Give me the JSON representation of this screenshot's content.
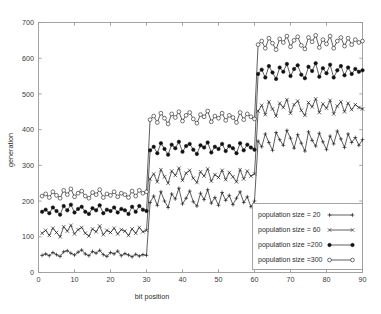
{
  "chart_data": {
    "type": "line",
    "title": "",
    "xlabel": "bit position",
    "ylabel": "generation",
    "xlim": [
      0,
      90
    ],
    "ylim": [
      0,
      700
    ],
    "xticks": [
      0,
      10,
      20,
      30,
      40,
      50,
      60,
      70,
      80,
      90
    ],
    "yticks": [
      0,
      100,
      200,
      300,
      400,
      500,
      600,
      700
    ],
    "grid": false,
    "legend_position": "lower right",
    "x": [
      1,
      2,
      3,
      4,
      5,
      6,
      7,
      8,
      9,
      10,
      11,
      12,
      13,
      14,
      15,
      16,
      17,
      18,
      19,
      20,
      21,
      22,
      23,
      24,
      25,
      26,
      27,
      28,
      29,
      30,
      31,
      32,
      33,
      34,
      35,
      36,
      37,
      38,
      39,
      40,
      41,
      42,
      43,
      44,
      45,
      46,
      47,
      48,
      49,
      50,
      51,
      52,
      53,
      54,
      55,
      56,
      57,
      58,
      59,
      60,
      61,
      62,
      63,
      64,
      65,
      66,
      67,
      68,
      69,
      70,
      71,
      72,
      73,
      74,
      75,
      76,
      77,
      78,
      79,
      80,
      81,
      82,
      83,
      84,
      85,
      86,
      87,
      88,
      89,
      90
    ],
    "series": [
      {
        "name": "population size = 20",
        "marker": "plus",
        "values": [
          48,
          52,
          47,
          56,
          50,
          45,
          58,
          61,
          54,
          49,
          57,
          63,
          52,
          47,
          59,
          54,
          62,
          50,
          45,
          56,
          52,
          60,
          47,
          53,
          49,
          44,
          51,
          46,
          50,
          48,
          196,
          214,
          188,
          226,
          200,
          182,
          220,
          206,
          236,
          192,
          208,
          228,
          198,
          186,
          222,
          204,
          232,
          194,
          210,
          188,
          224,
          202,
          216,
          190,
          208,
          226,
          196,
          212,
          184,
          200,
          368,
          352,
          388,
          364,
          342,
          392,
          372,
          356,
          398,
          376,
          348,
          386,
          362,
          340,
          394,
          370,
          354,
          390,
          366,
          344,
          382,
          360,
          396,
          374,
          350,
          388,
          364,
          378,
          356,
          372
        ]
      },
      {
        "name": "population size = 60",
        "marker": "cross",
        "values": [
          110,
          118,
          104,
          124,
          112,
          100,
          128,
          116,
          132,
          108,
          120,
          126,
          110,
          102,
          122,
          114,
          130,
          106,
          118,
          112,
          124,
          108,
          120,
          116,
          104,
          122,
          110,
          126,
          114,
          118,
          262,
          276,
          254,
          288,
          268,
          250,
          284,
          272,
          292,
          258,
          278,
          286,
          264,
          252,
          282,
          270,
          290,
          256,
          274,
          266,
          286,
          260,
          280,
          268,
          254,
          288,
          262,
          284,
          270,
          276,
          452,
          468,
          442,
          478,
          458,
          438,
          474,
          462,
          484,
          446,
          470,
          480,
          454,
          440,
          476,
          464,
          486,
          448,
          472,
          460,
          482,
          444,
          466,
          478,
          450,
          474,
          456,
          470,
          462,
          458
        ]
      },
      {
        "name": "population size =200",
        "marker": "filled-circle",
        "values": [
          170,
          176,
          166,
          182,
          172,
          162,
          186,
          174,
          190,
          168,
          178,
          184,
          170,
          164,
          180,
          174,
          188,
          166,
          176,
          172,
          182,
          168,
          178,
          174,
          164,
          184,
          170,
          186,
          176,
          172,
          342,
          352,
          334,
          362,
          346,
          330,
          358,
          348,
          366,
          338,
          354,
          360,
          344,
          332,
          356,
          350,
          364,
          336,
          352,
          346,
          360,
          340,
          354,
          348,
          334,
          362,
          342,
          358,
          350,
          344,
          556,
          568,
          546,
          578,
          560,
          542,
          574,
          562,
          584,
          550,
          570,
          580,
          554,
          544,
          576,
          564,
          586,
          548,
          572,
          558,
          582,
          546,
          566,
          578,
          552,
          574,
          556,
          570,
          562,
          566
        ]
      },
      {
        "name": "population size =300",
        "marker": "open-circle",
        "values": [
          214,
          220,
          210,
          226,
          216,
          208,
          230,
          218,
          234,
          212,
          222,
          228,
          214,
          208,
          224,
          218,
          232,
          210,
          220,
          216,
          226,
          212,
          222,
          218,
          210,
          228,
          214,
          230,
          222,
          226,
          428,
          438,
          420,
          446,
          432,
          416,
          444,
          434,
          450,
          424,
          440,
          448,
          430,
          418,
          442,
          436,
          452,
          422,
          438,
          432,
          446,
          426,
          440,
          434,
          420,
          448,
          428,
          444,
          436,
          430,
          638,
          648,
          628,
          656,
          642,
          624,
          654,
          644,
          662,
          632,
          650,
          660,
          636,
          626,
          658,
          646,
          664,
          630,
          652,
          640,
          662,
          628,
          648,
          658,
          634,
          656,
          638,
          652,
          644,
          648
        ]
      }
    ]
  },
  "axes": {
    "xlabel": "bit position",
    "ylabel": "generation"
  },
  "legend": {
    "entries": [
      {
        "label": "population size = 20",
        "marker": "plus-marker"
      },
      {
        "label": "population size = 60",
        "marker": "cross-marker"
      },
      {
        "label": "population size =200",
        "marker": "filled-circle-marker"
      },
      {
        "label": "population size =300",
        "marker": "open-circle-marker"
      }
    ]
  },
  "colors": {
    "line": "#1a1a1a",
    "axis": "#9a9a9a",
    "background": "#ffffff"
  }
}
